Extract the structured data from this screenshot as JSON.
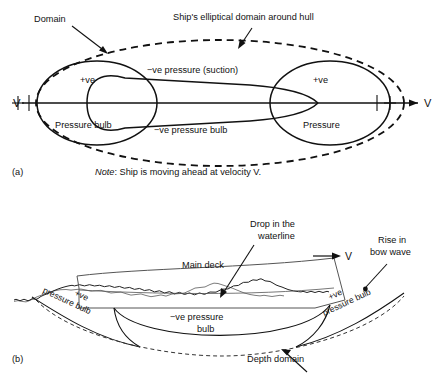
{
  "figure": {
    "panel_a": {
      "tag": "(a)",
      "labels": {
        "domain": "Domain",
        "ship_domain": "Ship's elliptical domain around hull",
        "pos_bow": "+ve",
        "pos_stern": "+ve",
        "pressure_bulb": "Pressure bulb",
        "pressure": "Pressure",
        "neg_suction": "−ve pressure (suction)",
        "neg_bulb": "−ve pressure bulb",
        "velocity": "V",
        "centerline_left": "℄",
        "centerline_right": "℄"
      },
      "note": {
        "prefix": "Note",
        "text": ": Ship is moving ahead at velocity V."
      }
    },
    "panel_b": {
      "tag": "(b)",
      "labels": {
        "drop_waterline": "Drop in the",
        "drop_waterline_2": "waterline",
        "rise_bow": "Rise in",
        "rise_bow_2": "bow wave",
        "main_deck": "Main deck",
        "velocity": "V",
        "pos_left": "+ve",
        "pos_left_2": "pressure bulb",
        "pos_right": "+ve",
        "pos_right_2": "pressure bulb",
        "neg_bulb": "−ve pressure",
        "neg_bulb_2": "bulb",
        "depth_domain": "Depth domain"
      }
    }
  },
  "colors": {
    "ink": "#111111",
    "hull": "#555555",
    "background": "#ffffff"
  }
}
